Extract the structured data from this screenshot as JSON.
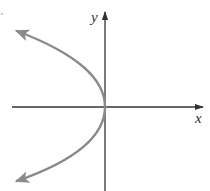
{
  "diagram": {
    "type": "coordinate-graph",
    "axes": {
      "x_label": "x",
      "y_label": "y",
      "color": "#333333"
    },
    "curve": {
      "name": "parabola",
      "equation_form": "x = -a*y^2",
      "vertex": [
        0,
        0
      ],
      "opens": "left",
      "color": "#8a8a8a",
      "arrows_at_ends": true
    }
  }
}
